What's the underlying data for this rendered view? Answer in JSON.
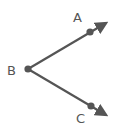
{
  "diagram": {
    "type": "angle",
    "name": "angle ABC",
    "stroke_color": "#555555",
    "vertex": {
      "label": "B",
      "x": 28,
      "y": 69,
      "label_x": 7,
      "label_y": 75
    },
    "rays": [
      {
        "point_label": "A",
        "point": {
          "x": 90,
          "y": 32
        },
        "tip": {
          "x": 108,
          "y": 22
        },
        "label_x": 73,
        "label_y": 22
      },
      {
        "point_label": "C",
        "point": {
          "x": 91,
          "y": 106
        },
        "tip": {
          "x": 108,
          "y": 116
        },
        "label_x": 76,
        "label_y": 123
      }
    ]
  }
}
